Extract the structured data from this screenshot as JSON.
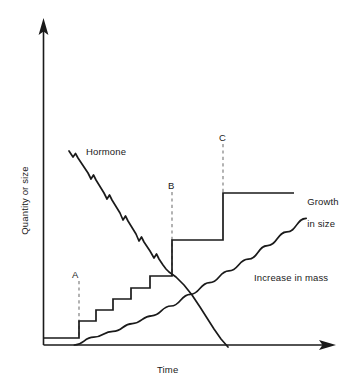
{
  "figure": {
    "axes": {
      "y_label": "Quantity or size",
      "x_label": "Time"
    },
    "labels": {
      "hormone": "Hormone",
      "growth_line1": "Growth",
      "growth_line2": "in size",
      "growth_full": "Growth in size",
      "mass": "Increase in mass",
      "marker_a": "A",
      "marker_b": "B",
      "marker_c": "C"
    },
    "colors": {
      "ink": "#1a1a1a",
      "curve": "#1a1a1a",
      "dashed_marker": "#8a8a8a",
      "background": "#ffffff"
    }
  },
  "chart_data": {
    "type": "line",
    "xlabel": "Time",
    "ylabel": "Quantity or size",
    "xlim": [
      0,
      100
    ],
    "ylim": [
      0,
      100
    ],
    "grid": false,
    "legend": "inline-annotations",
    "axis_style": "arrow-headed open axes, no tick marks, no numeric scale",
    "annotations": [
      {
        "label": "A",
        "x": 13,
        "y_top": 27,
        "note": "dashed vertical marker at first growth step"
      },
      {
        "label": "B",
        "x": 44,
        "y_top": 61,
        "note": "dashed vertical marker at large growth step"
      },
      {
        "label": "C",
        "x": 63,
        "y_top": 78,
        "note": "dashed vertical marker at final growth step"
      },
      {
        "label": "Hormone",
        "x": 17,
        "y": 67
      },
      {
        "label": "Growth in size",
        "x": 88,
        "y": 57
      },
      {
        "label": "Increase in mass",
        "x": 70,
        "y": 25
      }
    ],
    "series": [
      {
        "name": "Hormone",
        "style": "descending saw-toothed line reaching zero",
        "x": [
          13,
          16,
          19,
          22,
          25,
          28,
          31,
          34,
          37,
          40,
          43,
          46,
          49,
          52,
          55,
          58,
          61,
          63
        ],
        "y": [
          73,
          68,
          63,
          58,
          53,
          48,
          43,
          38,
          33,
          28,
          23,
          19,
          15,
          12,
          9,
          6,
          3,
          0
        ]
      },
      {
        "name": "Growth in size",
        "style": "step function",
        "x": [
          0,
          13,
          13,
          19,
          19,
          25,
          25,
          31,
          31,
          37,
          37,
          44,
          44,
          63,
          63,
          100
        ],
        "y": [
          2,
          2,
          7,
          7,
          12,
          12,
          18,
          18,
          24,
          24,
          30,
          30,
          48,
          48,
          62,
          62
        ]
      },
      {
        "name": "Increase in mass",
        "style": "smooth rising curve with small ripples",
        "x": [
          11,
          18,
          25,
          32,
          39,
          46,
          53,
          60,
          67,
          74,
          81,
          88,
          95
        ],
        "y": [
          0,
          4,
          7,
          11,
          15,
          20,
          26,
          32,
          38,
          44,
          51,
          58,
          65
        ]
      }
    ]
  }
}
